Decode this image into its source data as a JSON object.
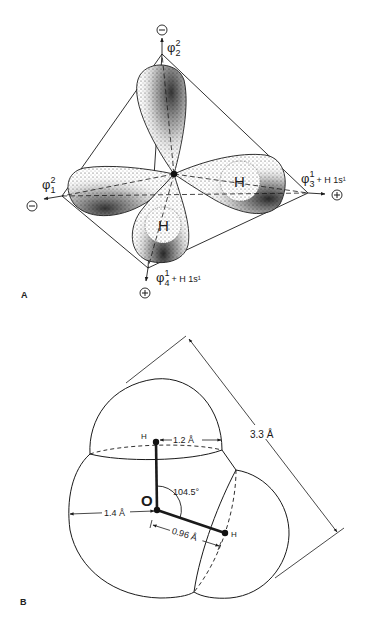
{
  "panel_a": {
    "label": "A",
    "title": "sp3 hybrid orbitals of oxygen in water (tetrahedral)",
    "orbitals": [
      {
        "id": "phi1",
        "symbol": "φ",
        "subscript": "1",
        "superscript": "2",
        "suffix": "",
        "sign": "⊖"
      },
      {
        "id": "phi2",
        "symbol": "φ",
        "subscript": "2",
        "superscript": "2",
        "suffix": "",
        "sign": "⊖"
      },
      {
        "id": "phi3",
        "symbol": "φ",
        "subscript": "3",
        "superscript": "1",
        "suffix": "+ H 1s¹",
        "sign": "⊕"
      },
      {
        "id": "phi4",
        "symbol": "φ",
        "subscript": "4",
        "superscript": "1",
        "suffix": "+ H 1s¹",
        "sign": "⊕"
      }
    ],
    "hydrogen_labels": [
      "H",
      "H"
    ]
  },
  "panel_b": {
    "label": "B",
    "title": "Water molecule van der Waals dimensions",
    "atoms": {
      "oxygen": "O",
      "hydrogen_top": "H",
      "hydrogen_right": "H"
    },
    "dimensions": {
      "h_vdw_radius": "1.2 Å",
      "o_vdw_radius": "1.4 Å",
      "bond_length": "0.96 Å",
      "bond_angle": "104.5°",
      "total_length": "3.3 Å"
    }
  },
  "colors": {
    "ink": "#1a1a1a",
    "background": "#ffffff",
    "stipple": "#2a2a2a"
  }
}
